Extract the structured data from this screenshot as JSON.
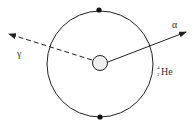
{
  "diagram": {
    "labels": {
      "alpha": "α",
      "gamma": "γ",
      "nucleus_mass": "4",
      "nucleus_atomic": "2",
      "nucleus_symbol": "He"
    },
    "colors": {
      "stroke": "#222222",
      "nucleus_fill": "#eeeeee",
      "background": "#ffffff"
    },
    "outer_circle": {
      "cx": 100,
      "cy": 64,
      "r": 53
    },
    "inner_circle": {
      "cx": 100,
      "cy": 63,
      "r": 7.5
    },
    "electrons": [
      {
        "cx": 99,
        "cy": 10
      },
      {
        "cx": 100,
        "cy": 117
      }
    ],
    "alpha_ray": {
      "x1": 108,
      "y1": 62,
      "x2": 186,
      "y2": 32,
      "style": "solid"
    },
    "gamma_ray": {
      "x1": 92,
      "y1": 60,
      "x2": 9,
      "y2": 34,
      "style": "dashed"
    }
  }
}
